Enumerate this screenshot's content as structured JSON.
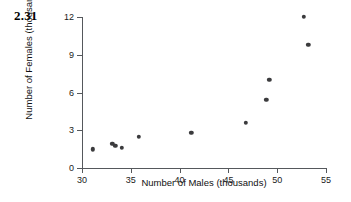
{
  "figure": {
    "problem_number": "2.31"
  },
  "chart_data": {
    "type": "scatter",
    "title": "",
    "xlabel": "Number of Males (thousands)",
    "ylabel": "Number of Females (thousands)",
    "xlim": [
      30,
      55
    ],
    "ylim": [
      0,
      12
    ],
    "xticks": [
      30,
      35,
      40,
      45,
      50,
      55
    ],
    "yticks": [
      0,
      3,
      6,
      9,
      12
    ],
    "xtick_labels": [
      "30",
      "35",
      "40",
      "45",
      "50",
      "55"
    ],
    "ytick_labels": [
      "0",
      "3",
      "6",
      "9",
      "12"
    ],
    "grid": false,
    "legend": false,
    "marker_color": "#3b3b3d",
    "axis_color": "#55585c",
    "background_color": "#ffffff",
    "points": [
      {
        "x": 31.1,
        "y": 1.5
      },
      {
        "x": 33.1,
        "y": 1.9
      },
      {
        "x": 33.4,
        "y": 1.75
      },
      {
        "x": 34.1,
        "y": 1.6
      },
      {
        "x": 35.8,
        "y": 2.5
      },
      {
        "x": 41.2,
        "y": 2.8
      },
      {
        "x": 46.8,
        "y": 3.6
      },
      {
        "x": 48.9,
        "y": 5.4
      },
      {
        "x": 49.2,
        "y": 7.0
      },
      {
        "x": 52.7,
        "y": 12.0
      },
      {
        "x": 53.2,
        "y": 9.8
      }
    ]
  }
}
